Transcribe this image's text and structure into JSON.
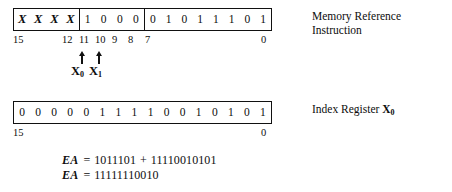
{
  "figure": {
    "instruction_word": {
      "fields": [
        {
          "name": "x-field",
          "bits": [
            "X",
            "X",
            "X",
            "X"
          ]
        },
        {
          "name": "opcode-field",
          "bits": [
            "1",
            "0",
            "0",
            "0"
          ]
        },
        {
          "name": "address-field",
          "bits": [
            "0",
            "1",
            "0",
            "1",
            "1",
            "1",
            "0",
            "1"
          ]
        }
      ],
      "ruler": [
        {
          "label": "15",
          "left": 0
        },
        {
          "label": "12",
          "left": 49
        },
        {
          "label": "11",
          "left": 66
        },
        {
          "label": "10",
          "left": 82
        },
        {
          "label": "9",
          "left": 99
        },
        {
          "label": "8",
          "left": 115
        },
        {
          "label": "7",
          "left": 132
        },
        {
          "label": "0",
          "left": 248
        }
      ],
      "caption_line1": "Memory Reference",
      "caption_line2": "Instruction"
    },
    "pointers": [
      {
        "name": "x0-pointer",
        "arrow_left": 64,
        "label_left": 58,
        "label": "X",
        "sub": "0"
      },
      {
        "name": "x1-pointer",
        "arrow_left": 81,
        "label_left": 76,
        "label": "X",
        "sub": "1"
      }
    ],
    "index_word": {
      "bits": [
        "0",
        "0",
        "0",
        "0",
        "0",
        "1",
        "1",
        "1",
        "1",
        "0",
        "0",
        "1",
        "0",
        "1",
        "0",
        "1"
      ],
      "ruler": [
        {
          "label": "15",
          "left": 0
        },
        {
          "label": "0",
          "left": 248
        }
      ],
      "caption_prefix": "Index Register ",
      "caption_register": "X",
      "caption_register_sub": "0"
    },
    "equations": [
      {
        "label": "EA",
        "eq": "=",
        "operand1": "1011101",
        "plus": "+",
        "operand2": "11110010101"
      },
      {
        "label": "EA",
        "eq": "=",
        "operand1": "11111110010",
        "plus": "",
        "operand2": ""
      }
    ]
  },
  "colors": {
    "ink": "#111111",
    "background": "#ffffff"
  }
}
